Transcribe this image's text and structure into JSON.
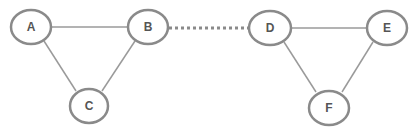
{
  "diagram": {
    "type": "graph",
    "colors": {
      "node_stroke": "#8a8a8a",
      "edge": "#9a9a9a",
      "label": "#555555",
      "background": "#ffffff"
    },
    "nodes": [
      {
        "id": "A",
        "label": "A",
        "cx": 31,
        "cy": 27
      },
      {
        "id": "B",
        "label": "B",
        "cx": 148,
        "cy": 27
      },
      {
        "id": "C",
        "label": "C",
        "cx": 89,
        "cy": 106
      },
      {
        "id": "D",
        "label": "D",
        "cx": 270,
        "cy": 28
      },
      {
        "id": "E",
        "label": "E",
        "cx": 387,
        "cy": 28
      },
      {
        "id": "F",
        "label": "F",
        "cx": 329,
        "cy": 108
      }
    ],
    "edges": [
      {
        "from": "A",
        "to": "B",
        "style": "solid"
      },
      {
        "from": "A",
        "to": "C",
        "style": "solid"
      },
      {
        "from": "B",
        "to": "C",
        "style": "solid"
      },
      {
        "from": "B",
        "to": "D",
        "style": "dotted"
      },
      {
        "from": "D",
        "to": "E",
        "style": "solid"
      },
      {
        "from": "D",
        "to": "F",
        "style": "solid"
      },
      {
        "from": "E",
        "to": "F",
        "style": "solid"
      }
    ]
  }
}
